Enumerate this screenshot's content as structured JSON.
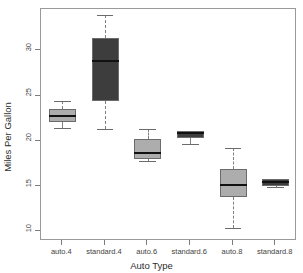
{
  "chart_data": {
    "type": "box",
    "title": "",
    "xlabel": "Auto Type",
    "ylabel": "Miles Per Gallon",
    "ylim": [
      9.0,
      34.6
    ],
    "yticks": [
      10,
      15,
      20,
      25,
      30
    ],
    "ytick_labels": [
      "10",
      "15",
      "20",
      "25",
      "30"
    ],
    "grid": false,
    "legend": "none",
    "categories": [
      "auto.4",
      "standard.4",
      "auto.6",
      "standard.6",
      "auto.8",
      "standard.8"
    ],
    "boxes": [
      {
        "category": "auto.4",
        "whisker_low": 21.5,
        "q1": 22.1,
        "median": 22.8,
        "q3": 23.6,
        "whisker_high": 24.4,
        "fill": "#adadad"
      },
      {
        "category": "standard.4",
        "whisker_low": 21.4,
        "q1": 24.4,
        "median": 28.9,
        "q3": 31.4,
        "whisker_high": 33.9,
        "fill": "#3d3d3d"
      },
      {
        "category": "auto.6",
        "whisker_low": 17.8,
        "q1": 18.1,
        "median": 18.7,
        "q3": 20.3,
        "whisker_high": 21.4,
        "fill": "#adadad"
      },
      {
        "category": "standard.6",
        "whisker_low": 19.7,
        "q1": 20.4,
        "median": 20.9,
        "q3": 21.1,
        "whisker_high": 21.1,
        "fill": "#3d3d3d"
      },
      {
        "category": "auto.8",
        "whisker_low": 10.4,
        "q1": 13.9,
        "median": 15.2,
        "q3": 16.9,
        "whisker_high": 19.3,
        "fill": "#adadad"
      },
      {
        "category": "standard.8",
        "whisker_low": 15.0,
        "q1": 15.1,
        "median": 15.5,
        "q3": 15.8,
        "whisker_high": 15.8,
        "fill": "#3d3d3d"
      }
    ],
    "colors": {
      "auto_fill": "#adadad",
      "standard_fill": "#3d3d3d",
      "box_border": "#6b6b6b",
      "median_line": "#111111",
      "whisker": "#808080",
      "frame": "#9a9a9a",
      "text": "#3f3f3f"
    }
  },
  "axes": {
    "y_title": "Miles Per Gallon",
    "x_title": "Auto Type"
  },
  "artifact": {
    "top_clipped_text": ""
  }
}
